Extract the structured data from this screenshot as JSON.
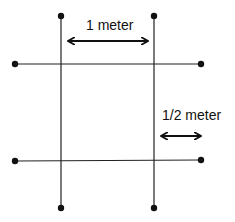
{
  "diagram": {
    "labels": {
      "top_spacing": "1 meter",
      "right_offset": "1/2 meter"
    },
    "colors": {
      "line": "#222222",
      "dot": "#111111",
      "background": "#ffffff"
    }
  }
}
